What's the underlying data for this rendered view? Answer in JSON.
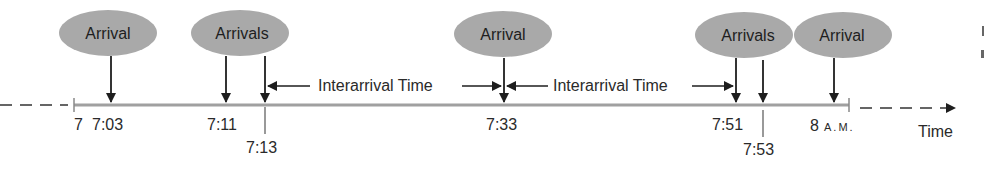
{
  "diagram": {
    "type": "timeline",
    "axis_label": "Time",
    "colors": {
      "bubble_fill": "#a9a9a9",
      "timeline": "#a0a0a0",
      "ink": "#1e1e1e"
    },
    "bubbles": [
      {
        "label": "Arrival",
        "times": [
          "7:03"
        ]
      },
      {
        "label": "Arrivals",
        "times": [
          "7:11",
          "7:13"
        ]
      },
      {
        "label": "Arrival",
        "times": [
          "7:33"
        ]
      },
      {
        "label": "Arrivals",
        "times": [
          "7:51",
          "7:53"
        ]
      },
      {
        "label": "Arrival",
        "times": [
          "8 A.M."
        ]
      }
    ],
    "ticks": [
      {
        "label": "7",
        "kind": "start"
      },
      {
        "label": "7:03"
      },
      {
        "label": "7:11"
      },
      {
        "label": "7:13",
        "offset": "below"
      },
      {
        "label": "7:33"
      },
      {
        "label": "7:51"
      },
      {
        "label": "7:53",
        "offset": "below"
      },
      {
        "label": "8",
        "suffix": "A.M.",
        "kind": "end"
      }
    ],
    "intervals": [
      {
        "label": "Interarrival Time",
        "from": "7:13",
        "to": "7:33"
      },
      {
        "label": "Interarrival Time",
        "from": "7:33",
        "to": "7:51"
      }
    ]
  }
}
